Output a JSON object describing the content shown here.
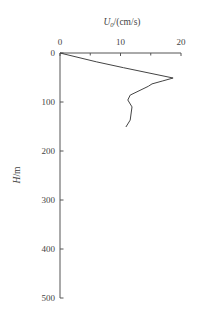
{
  "chart_data": {
    "type": "line",
    "title": "",
    "xlabel": "U_0/(cm/s)",
    "xlabel_main": "U",
    "xlabel_sub": "0",
    "xlabel_units": "/(cm/s)",
    "ylabel": "H/m",
    "ylabel_italic": "H",
    "ylabel_units": "/m",
    "xlim": [
      0,
      20
    ],
    "ylim": [
      0,
      500
    ],
    "y_inverted": true,
    "x_axis_position": "top",
    "x_ticks": [
      0,
      10,
      20
    ],
    "x_tick_labels": [
      "0",
      "10",
      "20"
    ],
    "x_minor_ticks": [
      5,
      15
    ],
    "y_ticks": [
      0,
      100,
      200,
      300,
      400,
      500
    ],
    "y_tick_labels": [
      "0",
      "100",
      "200",
      "300",
      "400",
      "500"
    ],
    "grid": false,
    "legend": null,
    "series": [
      {
        "name": "U0 profile",
        "color": "#444444",
        "points": [
          {
            "x": 0.0,
            "y": 0
          },
          {
            "x": 6.0,
            "y": 18
          },
          {
            "x": 10.5,
            "y": 30
          },
          {
            "x": 18.7,
            "y": 51
          },
          {
            "x": 17.0,
            "y": 57
          },
          {
            "x": 15.2,
            "y": 63
          },
          {
            "x": 14.6,
            "y": 68
          },
          {
            "x": 11.6,
            "y": 86
          },
          {
            "x": 11.2,
            "y": 96
          },
          {
            "x": 11.9,
            "y": 110
          },
          {
            "x": 11.6,
            "y": 137
          },
          {
            "x": 10.9,
            "y": 151
          }
        ]
      }
    ]
  }
}
